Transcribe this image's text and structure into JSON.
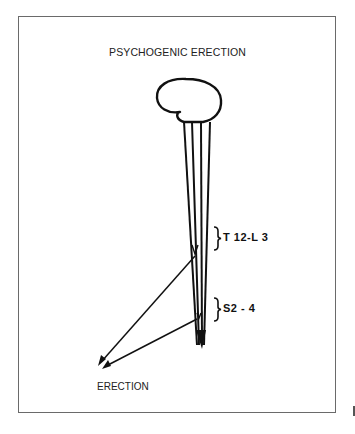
{
  "diagram": {
    "title": "PSYCHOGENIC ERECTION",
    "labels": {
      "thoracolumbar_segment": "T 12-L 3",
      "sacral_segment": "S2 - 4",
      "outcome": "ERECTION"
    },
    "elements": [
      {
        "id": "brain",
        "shape": "brain outline"
      },
      {
        "id": "spinal-cord",
        "shape": "four converging descending tracts"
      },
      {
        "id": "bracket-t12-l3",
        "label": "T 12-L 3"
      },
      {
        "id": "bracket-s2-4",
        "label": "S2 - 4"
      },
      {
        "id": "arrow-from-t12-l3",
        "target": "ERECTION"
      },
      {
        "id": "arrow-from-s2-4",
        "target": "ERECTION"
      }
    ],
    "colors": {
      "line": "#111111",
      "frame": "#6a6a6a",
      "background": "#ffffff"
    }
  }
}
